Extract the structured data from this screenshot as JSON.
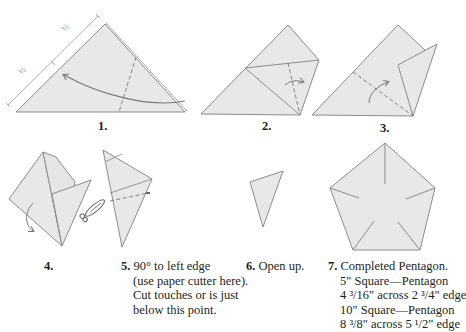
{
  "figures": [
    {
      "id": 1,
      "label": "1."
    },
    {
      "id": 2,
      "label": "2."
    },
    {
      "id": 3,
      "label": "3."
    },
    {
      "id": 4,
      "label": "4."
    },
    {
      "id": 5,
      "label": "5.",
      "caption_lines": [
        "90° to left edge",
        "(use paper cutter here).",
        "Cut touches or is just",
        "below this point."
      ]
    },
    {
      "id": 6,
      "label": "6.",
      "caption_lines": [
        "Open up."
      ]
    },
    {
      "id": 7,
      "label": "7.",
      "caption_lines": [
        "Completed Pentagon.",
        "5\" Square—Pentagon",
        "4 ³/16\" across 2 ³/4\" edge",
        "10\" Square—Pentagon",
        "8 ³/8\" across 5 ¹/2\" edge"
      ]
    }
  ],
  "dimension_marks": [
    "½",
    "½"
  ],
  "colors": {
    "paper_fill": "#e8e8e8",
    "edge": "#8c8c8c",
    "text": "#231f20"
  },
  "icons": [
    "fold-arrow-icon",
    "scissors-icon",
    "dashed-fold-line"
  ]
}
